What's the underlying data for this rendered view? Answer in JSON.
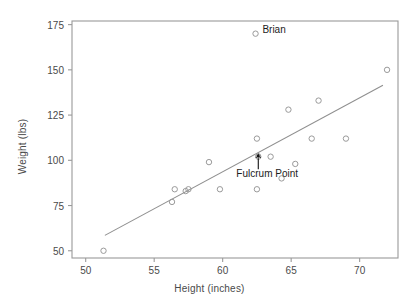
{
  "chart_data": {
    "type": "scatter",
    "title": "",
    "xlabel": "Height (inches)",
    "ylabel": "Weight (lbs)",
    "xlim": [
      49.0,
      72.8
    ],
    "ylim": [
      46.0,
      177.0
    ],
    "xticks": [
      50,
      55,
      60,
      65,
      70
    ],
    "yticks": [
      50,
      75,
      100,
      125,
      150,
      175
    ],
    "xtick_labels": [
      "50",
      "55",
      "60",
      "65",
      "70"
    ],
    "ytick_labels": [
      "50",
      "75",
      "100",
      "125",
      "150",
      "175"
    ],
    "grid": false,
    "legend": "none",
    "marker": "open-circle",
    "marker_color": "#9a9a9a",
    "line_color": "#8f8f8f",
    "axis_color": "#9a9a9a",
    "points": [
      {
        "x": 51.3,
        "y": 50
      },
      {
        "x": 56.3,
        "y": 77
      },
      {
        "x": 56.5,
        "y": 84
      },
      {
        "x": 57.3,
        "y": 83
      },
      {
        "x": 57.5,
        "y": 84
      },
      {
        "x": 59.0,
        "y": 99
      },
      {
        "x": 59.8,
        "y": 84
      },
      {
        "x": 62.4,
        "y": 170
      },
      {
        "x": 62.5,
        "y": 112
      },
      {
        "x": 62.6,
        "y": 102
      },
      {
        "x": 62.5,
        "y": 84
      },
      {
        "x": 63.5,
        "y": 102
      },
      {
        "x": 64.3,
        "y": 90
      },
      {
        "x": 64.8,
        "y": 128
      },
      {
        "x": 65.3,
        "y": 98
      },
      {
        "x": 66.5,
        "y": 112
      },
      {
        "x": 67.0,
        "y": 133
      },
      {
        "x": 69.0,
        "y": 112
      },
      {
        "x": 72.0,
        "y": 150
      }
    ],
    "trendline": {
      "x1": 51.4,
      "y1": 58.5,
      "x2": 71.7,
      "y2": 141.5
    },
    "annotations": [
      {
        "name": "brian-label",
        "text": "Brian",
        "x": 62.9,
        "y": 171.5,
        "anchor": "left"
      },
      {
        "name": "fulcrum-label",
        "text": "Fulcrum Point",
        "x": 61.0,
        "y": 92.0,
        "anchor": "left"
      }
    ],
    "fulcrum_marker": {
      "x": 62.6,
      "y": 102.5
    },
    "fulcrum_arrow": {
      "x": 62.6,
      "y_tail": 95.0,
      "y_head": 101.5
    }
  }
}
